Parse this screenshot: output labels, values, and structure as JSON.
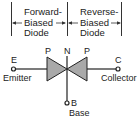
{
  "regions": [
    {
      "label_lines": [
        "Forward-",
        "Biased",
        "Diode"
      ]
    },
    {
      "label_lines": [
        "Reverse-",
        "Biased",
        "Diode"
      ]
    }
  ],
  "layers": {
    "left": "P",
    "middle": "N",
    "right": "P"
  },
  "terminals": {
    "emitter": {
      "letter": "E",
      "name": "Emitter"
    },
    "collector": {
      "letter": "C",
      "name": "Collector"
    },
    "base": {
      "letter": "B",
      "name": "Base"
    }
  },
  "colors": {
    "stroke": "#222222",
    "fill": "#a9a9a9",
    "background": "#ffffff"
  }
}
